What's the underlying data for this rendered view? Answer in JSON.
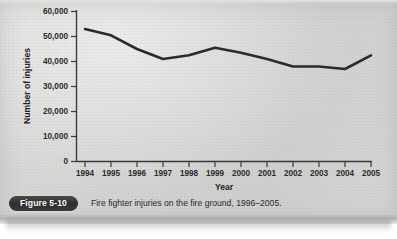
{
  "figure": {
    "badge_label": "Figure 5-10",
    "caption": "Fire fighter injuries on the fire ground, 1996–2005."
  },
  "chart_data": {
    "type": "line",
    "title": "",
    "xlabel": "Year",
    "ylabel": "Number of injuries",
    "categories": [
      "1994",
      "1995",
      "1996",
      "1997",
      "1998",
      "1999",
      "2000",
      "2001",
      "2002",
      "2003",
      "2004",
      "2005"
    ],
    "values": [
      53000,
      50500,
      45000,
      41000,
      42500,
      45500,
      43500,
      41000,
      38000,
      38000,
      37000,
      42500
    ],
    "series": [
      {
        "name": "Fire fighter injuries on the fire ground",
        "values": [
          53000,
          50500,
          45000,
          41000,
          42500,
          45500,
          43500,
          41000,
          38000,
          38000,
          37000,
          42500
        ]
      }
    ],
    "ylim": [
      0,
      60000
    ],
    "ytick_labels": [
      "0",
      "10,000",
      "20,000",
      "30,000",
      "40,000",
      "50,000",
      "60,000"
    ],
    "ytick_values": [
      0,
      10000,
      20000,
      30000,
      40000,
      50000,
      60000
    ],
    "xtick_labels": [
      "1994",
      "1995",
      "1996",
      "1997",
      "1998",
      "1999",
      "2000",
      "2001",
      "2002",
      "2003",
      "2004",
      "2005"
    ],
    "grid": false,
    "legend": false,
    "line_color": "#2b2b2b",
    "axis_color": "#3a3a3a",
    "markers": false
  },
  "colors": {
    "paper": "#d4d4d2",
    "line": "#2b2b2b",
    "badge_bg": "#323232",
    "badge_text": "#f4f4f4",
    "text": "#2b2b2b"
  }
}
